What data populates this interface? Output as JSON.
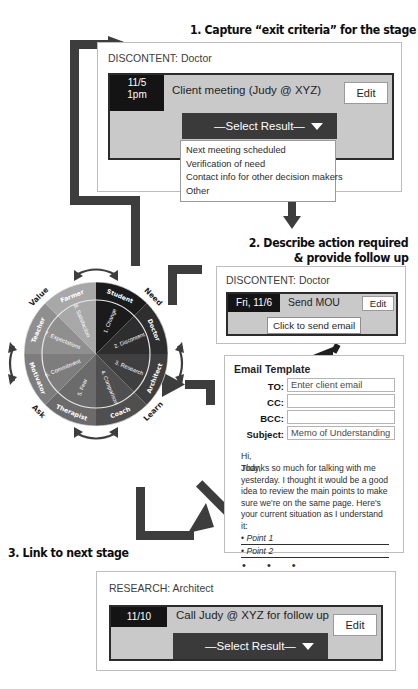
{
  "headings": {
    "step1": "1. Capture “exit criteria” for the stage",
    "step2_line1": "2. Describe action required",
    "step2_line2": "& provide follow up",
    "step3": "3. Link to next stage"
  },
  "panel1": {
    "title": "DISCONTENT: Doctor",
    "date": "11/5\n1pm",
    "task": "Client meeting (Judy @ XYZ)",
    "edit_label": "Edit",
    "select_label": "—Select Result—",
    "options": [
      "Next meeting scheduled",
      "Verification of need",
      "Contact info for other decision makers",
      "Other"
    ]
  },
  "panel2": {
    "title": "DISCONTENT: Doctor",
    "date": "Fri, 11/6",
    "task": "Send MOU",
    "edit_label": "Edit",
    "action_label": "Click to send email"
  },
  "email": {
    "title": "Email Template",
    "fields": [
      {
        "label": "TO:",
        "value": "Enter client email"
      },
      {
        "label": "CC:",
        "value": ""
      },
      {
        "label": "BCC:",
        "value": ""
      },
      {
        "label": "Subject:",
        "value": "Memo of Understanding"
      }
    ],
    "greeting": "Hi, Judy,",
    "body": "Thanks so much for talking with me yesterday. I thought it would be a good idea to review the main points to make sure we're on the same page. Here's your current situation as I understand it:",
    "bullet1": "Point 1",
    "bullet2": "Point 2",
    "bullet_marker": "•",
    "ellipsis": "•  •  •"
  },
  "panel3": {
    "title": "RESEARCH: Architect",
    "date": "11/10",
    "task": "Call Judy @ XYZ for follow up",
    "edit_label": "Edit",
    "select_label": "—Select Result—"
  },
  "wheel": {
    "outer_quadrants": [
      "Need",
      "Learn",
      "Ask",
      "Value"
    ],
    "roles": [
      "Student",
      "Doctor",
      "Architect",
      "Coach",
      "Therapist",
      "Motivator",
      "Teacher",
      "Farmer"
    ],
    "stages": [
      "1. Change",
      "2. Discontent",
      "3. Research",
      "4. Comparison",
      "5. Fear",
      "6. Commitment",
      "7. Expectations",
      "8. Satisfaction"
    ],
    "sector_colors": [
      "#1b1b1b",
      "#2e2e2e",
      "#3f3f3f",
      "#4f4f4f",
      "#6b6b6b",
      "#7d7d7d",
      "#8f8f8f",
      "#a8a8a8"
    ]
  },
  "colors": {
    "dark": "#1f1f1f",
    "task_fill": "#c9c9c9",
    "select_fill": "#3a3a3a",
    "arrow": "#3d3d3d"
  }
}
